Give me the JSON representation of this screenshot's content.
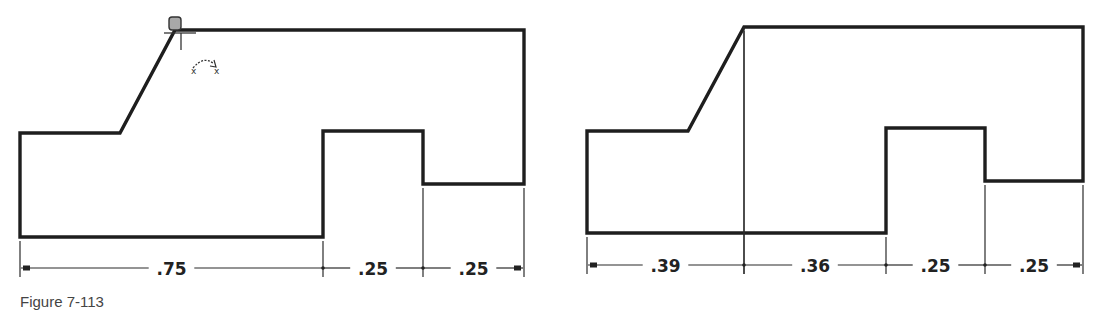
{
  "figure": {
    "caption": "Figure 7-113"
  },
  "left_view": {
    "outline_points": [
      [
        20,
        133
      ],
      [
        120,
        133
      ],
      [
        175,
        30
      ],
      [
        524,
        30
      ],
      [
        524,
        184
      ],
      [
        423,
        184
      ],
      [
        423,
        131
      ],
      [
        323,
        131
      ],
      [
        323,
        237
      ],
      [
        20,
        237
      ]
    ],
    "dimension_line_y": 268,
    "extension_lines_x": [
      20,
      323,
      423,
      524
    ],
    "dimensions": [
      {
        "label": ".75",
        "from_x": 20,
        "to_x": 323
      },
      {
        "label": ".25",
        "from_x": 323,
        "to_x": 423
      },
      {
        "label": ".25",
        "from_x": 423,
        "to_x": 524
      }
    ],
    "cursor": {
      "type": "vertex-select-cursor",
      "x": 177,
      "y": 28,
      "rotate_hint": "rotate-arrow-icon"
    }
  },
  "right_view": {
    "outline_points": [
      [
        587,
        131
      ],
      [
        688,
        131
      ],
      [
        744,
        27
      ],
      [
        1083,
        27
      ],
      [
        1083,
        181
      ],
      [
        985,
        181
      ],
      [
        985,
        128
      ],
      [
        886,
        128
      ],
      [
        886,
        233
      ],
      [
        587,
        233
      ]
    ],
    "construction_line": {
      "x": 744,
      "y1": 27,
      "y2": 265
    },
    "dimension_line_y": 265,
    "extension_lines_x": [
      587,
      744,
      886,
      985,
      1083
    ],
    "dimensions": [
      {
        "label": ".39",
        "from_x": 587,
        "to_x": 744
      },
      {
        "label": ".36",
        "from_x": 744,
        "to_x": 886
      },
      {
        "label": ".25",
        "from_x": 886,
        "to_x": 985
      },
      {
        "label": ".25",
        "from_x": 985,
        "to_x": 1083
      }
    ]
  },
  "colors": {
    "line": "#1e1e1e",
    "background": "#ffffff",
    "cursor_fill": "#a8a8a8"
  }
}
